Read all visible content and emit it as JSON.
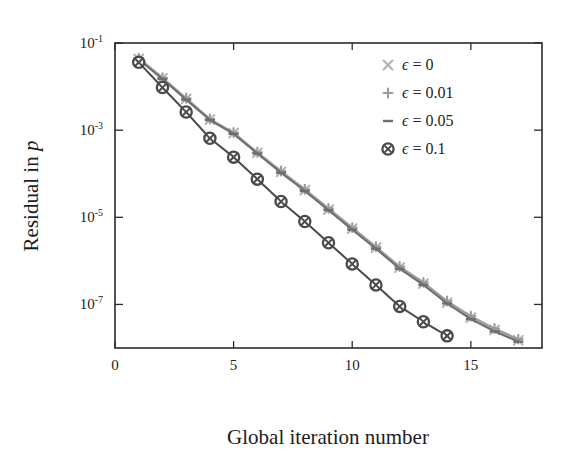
{
  "chart_data": {
    "type": "line",
    "title": "",
    "xlabel": "Global iteration number",
    "ylabel": "Residual in p",
    "yscale": "log",
    "xlim": [
      0,
      18
    ],
    "ylim": [
      1e-08,
      0.1
    ],
    "xticks": [
      0,
      5,
      10,
      15
    ],
    "xticklabels": [
      "0",
      "5",
      "10",
      "15"
    ],
    "yticks": [
      0.1,
      0.001,
      1e-05,
      1e-07
    ],
    "yticklabels": [
      "10^-1",
      "10^-3",
      "10^-5",
      "10^-7"
    ],
    "ytick_mantissa": "10",
    "ytick_exponents": [
      "-1",
      "-3",
      "-5",
      "-7"
    ],
    "grid": false,
    "legend_position": "top-right",
    "series": [
      {
        "name": "eps = 0",
        "legend_label_prefix": "ϵ",
        "legend_label_value": "0",
        "marker": "x",
        "color": "#b3b3b3",
        "x": [
          1,
          2,
          3,
          4,
          5,
          6,
          7,
          8,
          9,
          10,
          11,
          12,
          13,
          14,
          15,
          16,
          17
        ],
        "y": [
          0.043,
          0.0155,
          0.0052,
          0.00175,
          0.00085,
          0.0003,
          0.00011,
          4.2e-05,
          1.5e-05,
          5.5e-06,
          2e-06,
          7e-07,
          3e-07,
          1.1e-07,
          5e-08,
          2.6e-08,
          1.5e-08
        ]
      },
      {
        "name": "eps = 0.01",
        "legend_label_prefix": "ϵ",
        "legend_label_value": "0.01",
        "marker": "plus",
        "color": "#9a9a9a",
        "x": [
          1,
          2,
          3,
          4,
          5,
          6,
          7,
          8,
          9,
          10,
          11,
          12,
          13,
          14,
          15,
          16,
          17
        ],
        "y": [
          0.045,
          0.016,
          0.0054,
          0.0018,
          0.00088,
          0.00031,
          0.000115,
          4.4e-05,
          1.6e-05,
          5.8e-06,
          2.1e-06,
          7.4e-07,
          3.2e-07,
          1.2e-07,
          5.4e-08,
          2.8e-08,
          1.6e-08
        ]
      },
      {
        "name": "eps = 0.05",
        "legend_label_prefix": "ϵ",
        "legend_label_value": "0.05",
        "marker": "dash",
        "color": "#6e6e6e",
        "x": [
          1,
          2,
          3,
          4,
          5,
          6,
          7,
          8,
          9,
          10,
          11,
          12,
          13,
          14,
          15,
          16,
          17
        ],
        "y": [
          0.042,
          0.015,
          0.005,
          0.0017,
          0.00082,
          0.00029,
          0.000105,
          4e-05,
          1.45e-05,
          5.2e-06,
          1.9e-06,
          6.6e-07,
          2.8e-07,
          1.05e-07,
          4.6e-08,
          2.4e-08,
          1.4e-08
        ]
      },
      {
        "name": "eps = 0.1",
        "legend_label_prefix": "ϵ",
        "legend_label_value": "0.1",
        "marker": "circle-x",
        "color": "#4a4a4a",
        "x": [
          1,
          2,
          3,
          4,
          5,
          6,
          7,
          8,
          9,
          10,
          11,
          12,
          13,
          14
        ],
        "y": [
          0.036,
          0.0095,
          0.0026,
          0.00065,
          0.00024,
          7.5e-05,
          2.3e-05,
          8e-06,
          2.6e-06,
          8.5e-07,
          2.8e-07,
          9e-08,
          4e-08,
          1.9e-08
        ]
      }
    ]
  },
  "legend": {
    "items": [
      {
        "marker": "x-icon",
        "label": "ϵ = 0"
      },
      {
        "marker": "plus-icon",
        "label": "ϵ = 0.01"
      },
      {
        "marker": "dash-icon",
        "label": "ϵ = 0.05"
      },
      {
        "marker": "circle-x-icon",
        "label": "ϵ = 0.1"
      }
    ]
  },
  "colors": {
    "axis": "#2b2b2b",
    "text": "#232323",
    "background": "#ffffff",
    "series_eps_0": "#b3b3b3",
    "series_eps_001": "#9a9a9a",
    "series_eps_005": "#6e6e6e",
    "series_eps_01": "#4a4a4a"
  }
}
